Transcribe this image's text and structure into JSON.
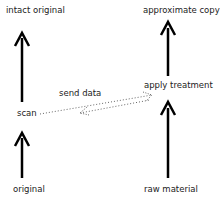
{
  "nodes": {
    "intact_original": "intact original",
    "scan": "scan",
    "original": "original",
    "approximate_copy": "approximate copy",
    "apply_treatment": "apply treatment",
    "raw_material": "raw material"
  },
  "edges": {
    "send_data": "send data"
  },
  "colors": {
    "arrow": "#000000",
    "dotted": "#555555",
    "text": "#222222"
  }
}
